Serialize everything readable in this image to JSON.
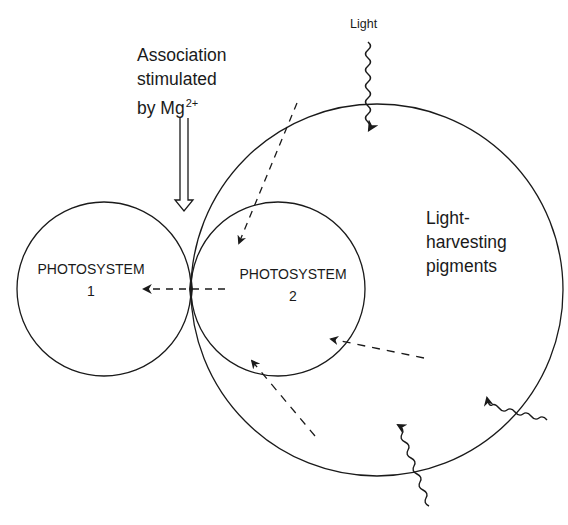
{
  "diagram": {
    "labels": {
      "association_line1": "Association",
      "association_line2": "stimulated",
      "association_line3_prefix": "by Mg",
      "association_superscript": "2+",
      "light": "Light",
      "light_harvesting_line1": "Light-",
      "light_harvesting_line2": "harvesting",
      "light_harvesting_line3": "pigments",
      "ps1_line1": "PHOTOSYSTEM",
      "ps1_line2": "1",
      "ps2_line1": "PHOTOSYSTEM",
      "ps2_line2": "2"
    },
    "nodes": [
      {
        "id": "photosystem-1",
        "shape": "circle",
        "cx": 104,
        "cy": 289,
        "r": 87
      },
      {
        "id": "photosystem-2",
        "shape": "circle",
        "cx": 278,
        "cy": 289,
        "r": 87
      },
      {
        "id": "light-harvesting-pigments",
        "shape": "circle",
        "cx": 377,
        "cy": 290,
        "r": 186
      }
    ],
    "edges": [
      {
        "from": "photosystem-2",
        "to": "photosystem-1",
        "style": "dashed",
        "meaning": "energy transfer"
      },
      {
        "from": "light-harvesting-pigments",
        "to": "photosystem-2",
        "style": "dashed",
        "count": 3
      },
      {
        "from": "light",
        "to": "light-harvesting-pigments",
        "style": "wavy",
        "count": 3
      },
      {
        "from": "Mg2+",
        "to": "contact-point",
        "style": "hollow-double-arrow"
      }
    ],
    "stroke_color": "#1a1a1a",
    "background": "#ffffff"
  }
}
